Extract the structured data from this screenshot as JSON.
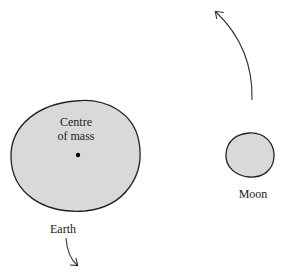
{
  "diagram": {
    "type": "earth-moon-barycentre",
    "labels": {
      "centre_of_mass_line1": "Centre",
      "centre_of_mass_line2": "of mass",
      "earth": "Earth",
      "moon": "Moon"
    },
    "colors": {
      "body_fill": "#d9d9d9",
      "outline": "#222222",
      "arrow": "#333333"
    },
    "arrows": [
      {
        "name": "moon-motion-arrow",
        "direction": "upward-left"
      },
      {
        "name": "earth-motion-arrow",
        "direction": "downward-right"
      }
    ]
  }
}
